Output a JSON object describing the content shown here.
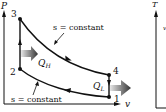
{
  "diagram": {
    "axes": {
      "y_label": "P",
      "x_label": "v"
    },
    "points": [
      {
        "id": "1",
        "label": "1"
      },
      {
        "id": "2",
        "label": "2"
      },
      {
        "id": "3",
        "label": "3"
      },
      {
        "id": "4",
        "label": "4"
      }
    ],
    "process_labels": {
      "upper_isentrope": "s = constant",
      "lower_isentrope": "s = constant"
    },
    "heat": {
      "q_in": {
        "symbol": "Q",
        "subscript": "H"
      },
      "q_out": {
        "symbol": "Q",
        "subscript": "L"
      }
    },
    "partial_right_diagram": {
      "y_label": "T",
      "side_label": "v"
    },
    "colors": {
      "line": "#111111",
      "arrow_dark": "#333333",
      "arrow_light": "#d8d8d8"
    }
  }
}
